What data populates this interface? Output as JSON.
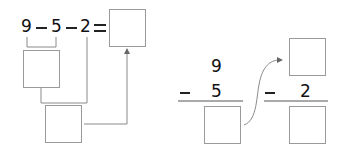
{
  "left_expression": {
    "terms": [
      "9",
      "5",
      "2"
    ],
    "operators": [
      "−",
      "−",
      "="
    ],
    "answer_box": ""
  },
  "right_vertical": {
    "step1": {
      "top": "9",
      "operator": "−",
      "subtrahend": "5",
      "result_box": ""
    },
    "step2": {
      "top_box": "",
      "operator": "−",
      "subtrahend": "2",
      "result_box": ""
    }
  },
  "colors": {
    "text": "#111111",
    "box_border": "#9a9a9a",
    "connector": "#8a8a8a"
  }
}
